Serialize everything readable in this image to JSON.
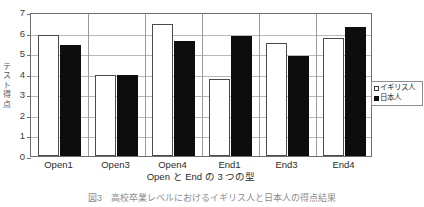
{
  "chart_data": {
    "type": "bar",
    "title": "",
    "xlabel": "Open と End の 3 つの型",
    "ylabel": "テスト得点",
    "categories": [
      "Open1",
      "Open3",
      "Open4",
      "End1",
      "End3",
      "End4"
    ],
    "series": [
      {
        "name": "イギリス人",
        "style": "white-open-bar",
        "values": [
          5.9,
          3.95,
          6.4,
          3.75,
          5.5,
          5.75
        ]
      },
      {
        "name": "日本人",
        "style": "black-filled-bar",
        "values": [
          5.4,
          3.95,
          5.6,
          5.85,
          4.85,
          6.25
        ]
      }
    ],
    "ylim": [
      0,
      7
    ],
    "yticks": [
      0,
      1,
      2,
      3,
      4,
      5,
      6,
      7
    ],
    "ytick_labels": [
      "0",
      "1",
      "2",
      "3",
      "4",
      "5",
      "6",
      "7"
    ],
    "grid": true,
    "grid_axis": "y",
    "legend_position": "right-middle",
    "legend_entries": [
      {
        "marker": "white-square",
        "label": "イギリス人"
      },
      {
        "marker": "black-square",
        "label": "日本人"
      }
    ]
  },
  "caption": "図3　高校卒業レベルにおけるイギリス人と日本人の得点結果",
  "colors": {
    "series_light_fill": "#ffffff",
    "series_light_border": "#4a4a4a",
    "series_dark_fill": "#0d0d0d",
    "gridline": "#b9b9b9",
    "axis_border": "#6e6e6e",
    "text": "#2b2b2b",
    "background": "#ffffff"
  }
}
